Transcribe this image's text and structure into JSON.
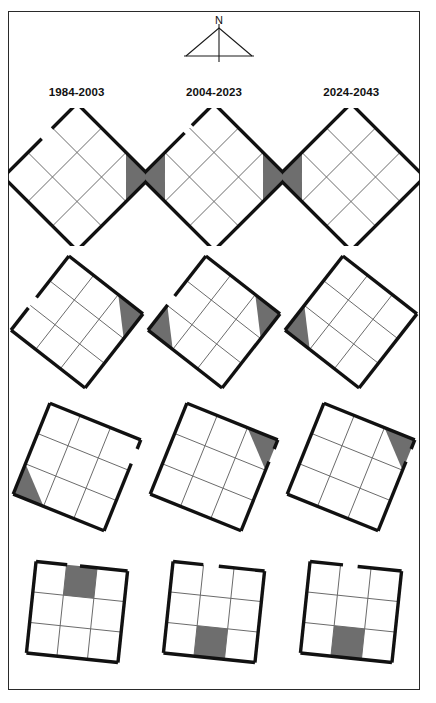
{
  "figure": {
    "type": "diagram",
    "frame_color": "#2a2a2a",
    "background_color": "#ffffff",
    "shade_color": "#6e6e6e",
    "outline_color": "#111111",
    "gridline_color": "#6b6b6b"
  },
  "north_arrow": {
    "label": "N",
    "icon": "north-arrow-icon"
  },
  "columns": [
    {
      "label": "1984-2003"
    },
    {
      "label": "2004-2023"
    },
    {
      "label": "2024-2043"
    }
  ],
  "rows": [
    {
      "rotation": 45
    },
    {
      "rotation": 38
    },
    {
      "rotation": 22
    },
    {
      "rotation": 6
    }
  ],
  "diagrams": [
    {
      "name": "diagram-r1c1",
      "row": 0,
      "col": 0,
      "rotation": 45,
      "size": 104,
      "shaded": [
        {
          "cell": "top-right",
          "shape": "triangle"
        }
      ],
      "gaps": [
        {
          "side": "bottom-left",
          "start": 0.52,
          "end": 0.66
        }
      ]
    },
    {
      "name": "diagram-r1c2",
      "row": 0,
      "col": 1,
      "rotation": 45,
      "size": 104,
      "shaded": [
        {
          "cell": "top-right",
          "shape": "triangle"
        },
        {
          "cell": "bottom-left",
          "shape": "triangle"
        }
      ],
      "gaps": [
        {
          "side": "bottom-left",
          "start": 0.6,
          "end": 0.7
        }
      ]
    },
    {
      "name": "diagram-r1c3",
      "row": 0,
      "col": 2,
      "rotation": 45,
      "size": 104,
      "shaded": [
        {
          "cell": "bottom-left",
          "shape": "triangle"
        }
      ],
      "gaps": []
    },
    {
      "name": "diagram-r2c1",
      "row": 1,
      "col": 0,
      "rotation": 38,
      "size": 94,
      "shaded": [
        {
          "cell": "top-right",
          "shape": "triangle"
        }
      ],
      "gaps": [
        {
          "side": "bottom-left",
          "start": 0.3,
          "end": 0.44
        }
      ]
    },
    {
      "name": "diagram-r2c2",
      "row": 1,
      "col": 1,
      "rotation": 38,
      "size": 94,
      "shaded": [
        {
          "cell": "top-right",
          "shape": "triangle"
        },
        {
          "cell": "bottom-left",
          "shape": "triangle-small"
        }
      ],
      "gaps": [
        {
          "side": "bottom-left",
          "start": 0.34,
          "end": 0.46
        }
      ]
    },
    {
      "name": "diagram-r2c3",
      "row": 1,
      "col": 2,
      "rotation": 38,
      "size": 94,
      "shaded": [
        {
          "cell": "bottom-left",
          "shape": "triangle-small"
        }
      ],
      "gaps": []
    },
    {
      "name": "diagram-r3c1",
      "row": 2,
      "col": 0,
      "rotation": 22,
      "size": 98,
      "shaded": [
        {
          "cell": "bottom-left",
          "shape": "triangle"
        }
      ],
      "gaps": [
        {
          "side": "top-right",
          "start": 0.1,
          "end": 0.26
        }
      ]
    },
    {
      "name": "diagram-r3c2",
      "row": 2,
      "col": 1,
      "rotation": 22,
      "size": 98,
      "shaded": [
        {
          "cell": "top-right",
          "shape": "triangle"
        }
      ],
      "gaps": [
        {
          "side": "top-right",
          "start": 0.1,
          "end": 0.24
        }
      ]
    },
    {
      "name": "diagram-r3c3",
      "row": 2,
      "col": 2,
      "rotation": 22,
      "size": 98,
      "shaded": [
        {
          "cell": "top-right",
          "shape": "triangle"
        }
      ],
      "gaps": [
        {
          "side": "top-right",
          "start": 0.1,
          "end": 0.24
        }
      ]
    },
    {
      "name": "diagram-r4c1",
      "row": 3,
      "col": 0,
      "rotation": 6,
      "size": 92,
      "shaded": [
        {
          "cell": "top-middle",
          "shape": "rect"
        }
      ],
      "gaps": [
        {
          "side": "top",
          "start": 0.34,
          "end": 0.48
        }
      ]
    },
    {
      "name": "diagram-r4c2",
      "row": 3,
      "col": 1,
      "rotation": 6,
      "size": 92,
      "shaded": [
        {
          "cell": "bottom-middle",
          "shape": "rect"
        }
      ],
      "gaps": [
        {
          "side": "top",
          "start": 0.33,
          "end": 0.5
        }
      ]
    },
    {
      "name": "diagram-r4c3",
      "row": 3,
      "col": 2,
      "rotation": 6,
      "size": 92,
      "shaded": [
        {
          "cell": "bottom-middle",
          "shape": "rect"
        }
      ],
      "gaps": [
        {
          "side": "top",
          "start": 0.36,
          "end": 0.52
        }
      ]
    }
  ]
}
